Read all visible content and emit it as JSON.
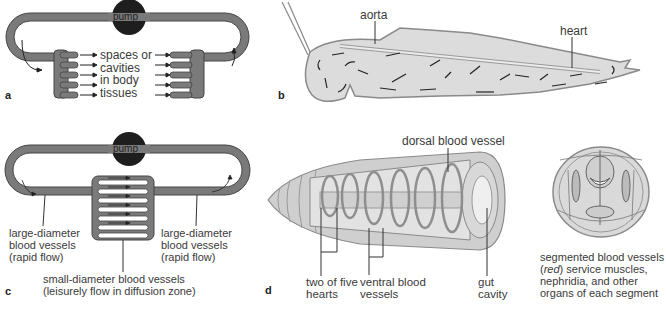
{
  "panels": {
    "a": {
      "letter": "a",
      "pump_label": "pump",
      "center_label": [
        "spaces or",
        "cavities",
        "in body",
        "tissues"
      ]
    },
    "b": {
      "letter": "b",
      "labels": {
        "aorta": "aorta",
        "heart": "heart"
      }
    },
    "c": {
      "letter": "c",
      "pump_label": "pump",
      "left_label": [
        "large-diameter",
        "blood vessels",
        "(rapid flow)"
      ],
      "right_label": [
        "large-diameter",
        "blood vessels",
        "(rapid flow)"
      ],
      "bottom_label": [
        "small-diameter blood vessels",
        "(leisurely flow in diffusion zone)"
      ]
    },
    "d": {
      "letter": "d",
      "labels": {
        "dorsal": "dorsal blood vessel",
        "hearts": [
          "two of five",
          "hearts"
        ],
        "ventral": [
          "ventral blood",
          "vessels"
        ],
        "gut": [
          "gut",
          "cavity"
        ]
      }
    },
    "cross_section": {
      "caption_pre": "segmented blood vessels",
      "caption_paren_open": "(",
      "caption_italic": "red",
      "caption_paren_close": ") service muscles,",
      "caption_line3": "nephridia, and other",
      "caption_line4": "organs of each segment"
    }
  },
  "colors": {
    "vessel": "#7a7a7a",
    "vessel_dark": "#4a4a4a",
    "pump": "#1e1e1e",
    "tissue": "#d4d4d4",
    "background": "#ffffff"
  }
}
